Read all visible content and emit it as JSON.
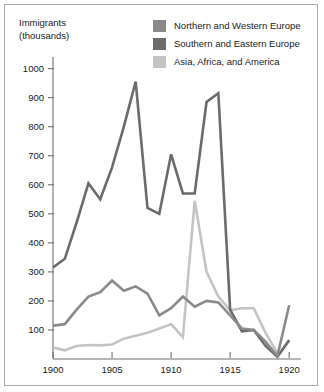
{
  "axis": {
    "y_title_line1": "Immigrants",
    "y_title_line2": "(thousands)",
    "y_ticks": [
      "1000",
      "900",
      "800",
      "700",
      "600",
      "500",
      "400",
      "300",
      "200",
      "100"
    ],
    "x_ticks": [
      "1900",
      "1905",
      "1910",
      "1915",
      "1920"
    ]
  },
  "legend": {
    "items": [
      {
        "label": "Northern and Western Europe",
        "color": "#8a8a8a",
        "swatch_name": "legend-swatch-northern-western-europe"
      },
      {
        "label": "Southern and Eastern Europe",
        "color": "#6b6b6b",
        "swatch_name": "legend-swatch-southern-eastern-europe"
      },
      {
        "label": "Asia, Africa, and America",
        "color": "#c4c4c4",
        "swatch_name": "legend-swatch-asia-africa-america"
      }
    ]
  },
  "chart_data": {
    "type": "line",
    "title": "",
    "xlabel": "",
    "ylabel": "Immigrants (thousands)",
    "xlim": [
      1900,
      1921
    ],
    "ylim": [
      0,
      1040
    ],
    "grid": false,
    "legend_position": "top-right",
    "x": [
      1900,
      1901,
      1902,
      1903,
      1904,
      1905,
      1906,
      1907,
      1908,
      1909,
      1910,
      1911,
      1912,
      1913,
      1914,
      1915,
      1916,
      1917,
      1918,
      1919,
      1920
    ],
    "series": [
      {
        "name": "Southern and Eastern Europe",
        "color": "#6b6b6b",
        "values": [
          315,
          345,
          470,
          605,
          550,
          660,
          800,
          955,
          520,
          500,
          705,
          570,
          570,
          885,
          915,
          170,
          95,
          100,
          45,
          8,
          65
        ]
      },
      {
        "name": "Northern and Western Europe",
        "color": "#8a8a8a",
        "values": [
          115,
          120,
          170,
          215,
          230,
          270,
          235,
          250,
          225,
          150,
          175,
          215,
          180,
          200,
          195,
          150,
          105,
          100,
          60,
          10,
          185
        ]
      },
      {
        "name": "Asia, Africa, and America",
        "color": "#c4c4c4",
        "values": [
          40,
          30,
          45,
          48,
          47,
          50,
          70,
          80,
          90,
          105,
          120,
          75,
          545,
          300,
          215,
          168,
          175,
          175,
          90,
          20,
          null
        ]
      }
    ]
  }
}
